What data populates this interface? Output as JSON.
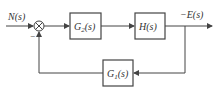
{
  "diagram": {
    "input_label": "N(s)",
    "sum_sign": "−",
    "blocks": {
      "g2": {
        "name": "G",
        "sub": "2",
        "arg": "(s)"
      },
      "h": {
        "label": "H(s)"
      },
      "g1": {
        "name": "G",
        "sub": "1",
        "arg": "(s)"
      }
    },
    "output_label": "−E(s)",
    "line_color": "#444444"
  }
}
